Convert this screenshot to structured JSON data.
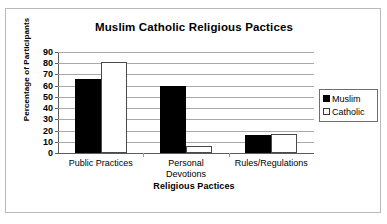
{
  "chart_data": {
    "type": "bar",
    "title": "Muslim Catholic Religious Pactices",
    "xlabel": "Religious Pactices",
    "ylabel": "Percentage of Participants",
    "categories": [
      "Public Practices",
      "Personal\nDevotions",
      "Rules/Regulations"
    ],
    "series": [
      {
        "name": "Muslim",
        "values": [
          66,
          60,
          16
        ],
        "color": "#000000",
        "swatch": "fill-black"
      },
      {
        "name": "Catholic",
        "values": [
          81,
          6,
          17
        ],
        "color": "#ffffff",
        "swatch": "fill-white"
      }
    ],
    "ylim": [
      0,
      90
    ],
    "yticks": [
      0,
      10,
      20,
      30,
      40,
      50,
      60,
      70,
      80,
      90
    ],
    "ytick_labels": [
      "0",
      "10",
      "20",
      "30",
      "40",
      "50",
      "60",
      "70",
      "80",
      "90"
    ],
    "grid": true,
    "legend_position": "right",
    "legend_entries": [
      "Muslim",
      "Catholic"
    ]
  },
  "axis": {
    "y_tick_0": "0",
    "y_tick_10": "10",
    "y_tick_20": "20",
    "y_tick_30": "30",
    "y_tick_40": "40",
    "y_tick_50": "50",
    "y_tick_60": "60",
    "y_tick_70": "70",
    "y_tick_80": "80",
    "y_tick_90": "90"
  },
  "categories": {
    "c0": "Public Practices",
    "c1": "Personal\nDevotions",
    "c2": "Rules/Regulations"
  },
  "legend": {
    "muslim": "Muslim",
    "catholic": "Catholic"
  }
}
